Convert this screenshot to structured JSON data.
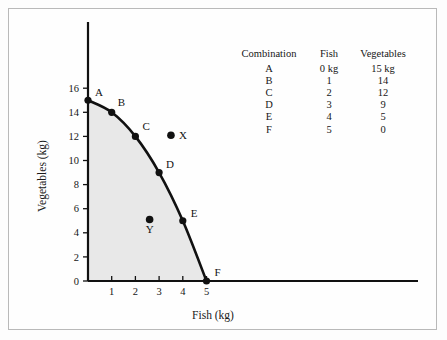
{
  "chart_data": {
    "type": "line",
    "title": "",
    "xlabel": "Fish (kg)",
    "ylabel": "Vegetables (kg)",
    "xlim": [
      0,
      5.6
    ],
    "ylim": [
      0,
      16.8
    ],
    "xticks": [
      "1",
      "2",
      "3",
      "4",
      "5"
    ],
    "yticks": [
      "0",
      "2",
      "4",
      "6",
      "8",
      "10",
      "12",
      "14",
      "16"
    ],
    "grid": false,
    "legend": "none",
    "shaded_region": true,
    "shade_color": "#e8e8e8",
    "curve_color": "#111111",
    "series": [
      {
        "name": "Production possibility frontier",
        "points": [
          {
            "label": "A",
            "fish": 0,
            "vegetables": 15
          },
          {
            "label": "B",
            "fish": 1,
            "vegetables": 14
          },
          {
            "label": "C",
            "fish": 2,
            "vegetables": 12
          },
          {
            "label": "D",
            "fish": 3,
            "vegetables": 9
          },
          {
            "label": "E",
            "fish": 4,
            "vegetables": 5
          },
          {
            "label": "F",
            "fish": 5,
            "vegetables": 0
          }
        ]
      }
    ],
    "annotations": [
      {
        "label": "X",
        "fish": 3.5,
        "vegetables": 12.1,
        "position": "outside-frontier"
      },
      {
        "label": "Y",
        "fish": 2.6,
        "vegetables": 5.1,
        "position": "inside-frontier"
      }
    ]
  },
  "table": {
    "headers": {
      "combination": "Combination",
      "fish": "Fish",
      "vegetables": "Vegetables"
    },
    "rows": [
      {
        "combination": "A",
        "fish": "0 kg",
        "vegetables": "15 kg"
      },
      {
        "combination": "B",
        "fish": "1",
        "vegetables": "14"
      },
      {
        "combination": "C",
        "fish": "2",
        "vegetables": "12"
      },
      {
        "combination": "D",
        "fish": "3",
        "vegetables": "9"
      },
      {
        "combination": "E",
        "fish": "4",
        "vegetables": "5"
      },
      {
        "combination": "F",
        "fish": "5",
        "vegetables": "0"
      }
    ]
  }
}
